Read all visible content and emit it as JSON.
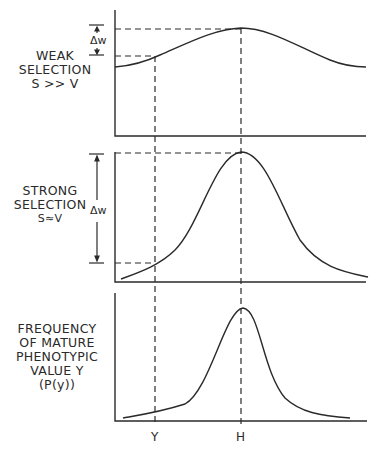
{
  "panels": [
    {
      "id": "weak",
      "label_lines": [
        "WEAK",
        "SELECTION",
        "S >> V"
      ],
      "delta_label": "Δw"
    },
    {
      "id": "strong",
      "label_lines": [
        "STRONG",
        "SELECTION",
        "S≈V"
      ],
      "delta_label": "Δw"
    },
    {
      "id": "frequency",
      "label_lines": [
        "FREQUENCY",
        "OF MATURE",
        "PHENOTYPIC",
        "VALUE Y",
        "(P(y))"
      ]
    }
  ],
  "x_labels": {
    "y": "Y",
    "h": "H"
  },
  "colors": {
    "ink": "#2a2a2a",
    "background": "#ffffff"
  }
}
